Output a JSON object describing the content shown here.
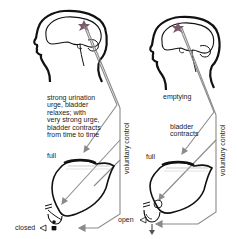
{
  "panels": [
    {
      "id": "left",
      "state_label": "strong urination\nurge, bladder\nrelaxes; with\nvery strong urge,\nbladder contracts\nfrom time to time",
      "fill_label": "full",
      "sphincter_label": "closed",
      "control_label": "voluntary control"
    },
    {
      "id": "right",
      "state_label": "emptying",
      "contract_label": "bladder\ncontracts",
      "fill_label": "full",
      "sphincter_label": "open",
      "control_label": "voluntary control"
    }
  ],
  "colors": {
    "outline": "#111111",
    "nerve": "#8a8a8a",
    "brain_center": "#7a5a6a",
    "background": "#ffffff"
  }
}
